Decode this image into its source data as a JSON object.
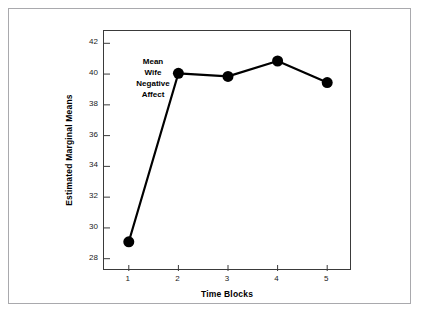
{
  "chart_data": {
    "type": "line",
    "title": "",
    "xlabel": "Time Blocks",
    "ylabel": "Estimated Marginal Means",
    "categories": [
      "1",
      "2",
      "3",
      "4",
      "5"
    ],
    "x": [
      1,
      2,
      3,
      4,
      5
    ],
    "series": [
      {
        "name": "Mean Wife Negative Affect",
        "values": [
          29.1,
          40.05,
          39.85,
          40.85,
          39.45
        ]
      }
    ],
    "xlim": [
      0.5,
      5.5
    ],
    "ylim": [
      27.2,
      42.8
    ],
    "yticks": [
      28,
      30,
      32,
      34,
      36,
      38,
      40,
      42
    ],
    "ytick_labels": [
      "28",
      "30",
      "32",
      "34",
      "36",
      "38",
      "40",
      "42"
    ],
    "xticks": [
      1,
      2,
      3,
      4,
      5
    ],
    "xtick_labels": [
      "1",
      "2",
      "3",
      "4",
      "5"
    ],
    "grid": false,
    "legend": "none",
    "annotations": [
      {
        "text_lines": [
          "Mean",
          "Wife",
          "Negative",
          "Affect"
        ],
        "anchor_x": 2,
        "anchor_y": 40.05
      }
    ],
    "style": {
      "line_color": "#000000",
      "marker_color": "#000000",
      "marker": "circle",
      "line_width": 2.2,
      "marker_size": 5.5,
      "axis_color": "#3a3a3a",
      "frame_color": "#a9a9ad",
      "background": "#ffffff",
      "text_color": "#000000"
    }
  }
}
